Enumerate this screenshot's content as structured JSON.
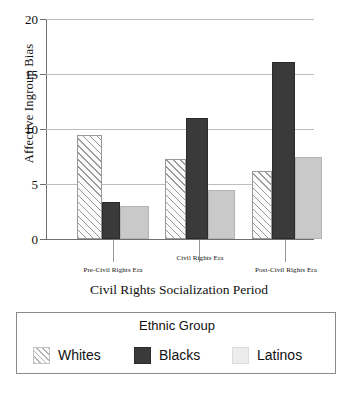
{
  "chart_data": {
    "type": "bar",
    "title": "",
    "xlabel": "Civil Rights Socialization Period",
    "ylabel": "Affective Ingroup Bias",
    "categories": [
      "Pre-Civil Rights Era",
      "Civil Rights Era",
      "Post-Civil Rights Era"
    ],
    "series": [
      {
        "name": "Whites",
        "values": [
          9.5,
          7.3,
          6.2
        ],
        "color": "#fbfbfb",
        "pattern": "diagonal-hatch"
      },
      {
        "name": "Blacks",
        "values": [
          3.4,
          11.0,
          16.1
        ],
        "color": "#3a3a3a",
        "pattern": "solid"
      },
      {
        "name": "Latinos",
        "values": [
          3.0,
          4.5,
          7.5
        ],
        "color": "#c9c9c9",
        "pattern": "solid"
      }
    ],
    "ylim": [
      0,
      20
    ],
    "yticks": [
      0,
      5,
      10,
      15,
      20
    ],
    "ytick_labels": [
      "0",
      "5",
      "10",
      "15",
      "20"
    ],
    "grid": true,
    "grid_axis": "y",
    "legend_position": "bottom",
    "legend_title": "Ethnic Group"
  },
  "axes": {
    "y_title": "Affective Ingroup Bias",
    "x_title": "Civil Rights Socialization Period",
    "y_tick_labels": [
      "20",
      "15",
      "10",
      "5",
      "0"
    ],
    "x_tick_labels": [
      "Pre-Civil Rights Era",
      "Civil Rights Era",
      "Post-Civil Rights Era"
    ]
  },
  "legend": {
    "title": "Ethnic Group",
    "entries": [
      {
        "label": "Whites"
      },
      {
        "label": "Blacks"
      },
      {
        "label": "Latinos"
      }
    ]
  }
}
